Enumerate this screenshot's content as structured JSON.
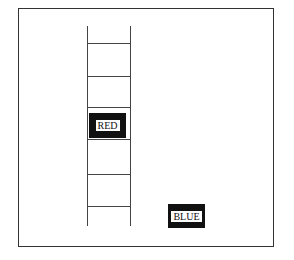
{
  "diagram": {
    "frame": {
      "x": 18,
      "y": 8,
      "width": 256,
      "height": 239
    },
    "ladder": {
      "left_rail_x": 87,
      "right_rail_x": 130,
      "top_y": 26,
      "bottom_y": 226,
      "rungs_y": [
        43,
        76,
        107,
        139,
        174,
        206
      ]
    },
    "labels": [
      {
        "id": "red",
        "text": "RED",
        "x": 89,
        "y": 113,
        "width": 37,
        "height": 25
      },
      {
        "id": "blue",
        "text": "BLUE",
        "x": 168,
        "y": 204,
        "width": 37,
        "height": 24
      }
    ],
    "colors": {
      "stroke": "#444444",
      "box_fill": "#111111",
      "background": "#ffffff"
    }
  }
}
